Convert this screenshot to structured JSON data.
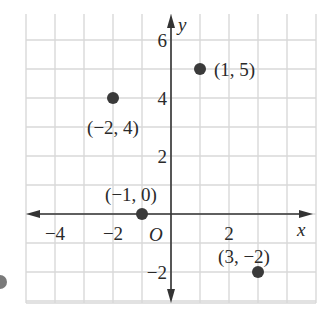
{
  "chart_data": {
    "type": "scatter",
    "title": "",
    "xlabel": "x",
    "ylabel": "y",
    "origin_label": "O",
    "xlim": [
      -5,
      5
    ],
    "ylim": [
      -3,
      7
    ],
    "grid": true,
    "x_ticks": [
      {
        "value": -4,
        "label": "−4"
      },
      {
        "value": -2,
        "label": "−2"
      },
      {
        "value": 2,
        "label": "2"
      }
    ],
    "y_ticks": [
      {
        "value": 6,
        "label": "6"
      },
      {
        "value": 4,
        "label": "4"
      },
      {
        "value": 2,
        "label": "2"
      },
      {
        "value": -2,
        "label": "−2"
      }
    ],
    "points": [
      {
        "x": -2,
        "y": 4,
        "label": "(−2, 4)"
      },
      {
        "x": 1,
        "y": 5,
        "label": "(1, 5)"
      },
      {
        "x": -1,
        "y": 0,
        "label": "(−1, 0)"
      },
      {
        "x": 3,
        "y": -2,
        "label": "(3, −2)"
      }
    ],
    "colors": {
      "grid": "#d9d9d9",
      "axis": "#333333",
      "point": "#3a3a3a"
    }
  }
}
